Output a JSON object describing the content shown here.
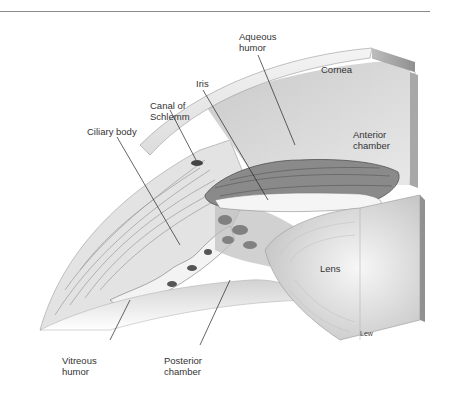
{
  "figure": {
    "labels": {
      "aqueous_humor": "Aqueous\nhumor",
      "cornea": "Cornea",
      "iris": "Iris",
      "canal_of_schlemm": "Canal of\nSchlemm",
      "ciliary_body": "Ciliary body",
      "anterior_chamber": "Anterior\nchamber",
      "lens": "Lens",
      "vitreous_humor": "Vitreous\nhumor",
      "posterior_chamber": "Posterior\nchamber"
    },
    "credit": "Lew"
  },
  "colors": {
    "rule": "#8a8a8a",
    "label_text": "#333333",
    "leader_line": "#222222"
  }
}
